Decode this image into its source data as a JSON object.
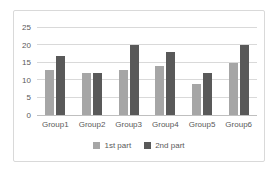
{
  "chart_data": {
    "type": "bar",
    "title": "",
    "categories": [
      "Group1",
      "Group2",
      "Group3",
      "Group4",
      "Group5",
      "Group6"
    ],
    "series": [
      {
        "name": "1st part",
        "color": "#a6a6a6",
        "values": [
          13,
          12,
          13,
          14,
          9,
          15
        ]
      },
      {
        "name": "2nd part",
        "color": "#595959",
        "values": [
          17,
          12,
          20,
          18,
          12,
          20
        ]
      }
    ],
    "ylim": [
      0,
      25
    ],
    "ytick_step": 5,
    "ytick_labels": [
      "0",
      "5",
      "10",
      "15",
      "20",
      "25"
    ],
    "grid": true,
    "legend_position": "bottom",
    "colors": {
      "gridline": "#d9d9d9",
      "axis_line": "#bfbfbf",
      "axis_text": "#595959",
      "frame_border": "#d9d9d9",
      "background": "#ffffff"
    }
  }
}
